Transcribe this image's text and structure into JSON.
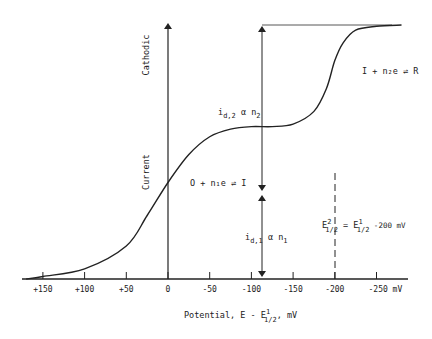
{
  "chart_data": {
    "type": "line",
    "title": "",
    "xlabel": "Potential, E - E¹₁/₂, mV",
    "xlabel_parts": {
      "main": "Potential, E - E",
      "sup": "1",
      "sub": "1/2",
      "tail": ", mV"
    },
    "ylabel_top": "Cathodic",
    "ylabel_bottom": "Current",
    "x_ticks": [
      "+150",
      "+100",
      "+50",
      "0",
      "-50",
      "-100",
      "-150",
      "-200",
      "-250 mV"
    ],
    "x_tick_values": [
      150,
      100,
      50,
      0,
      -50,
      -100,
      -150,
      -200,
      -250
    ],
    "xlim": [
      170,
      -280
    ],
    "grid": false,
    "series": [
      {
        "name": "two-step polarographic wave",
        "x": [
          170,
          150,
          100,
          50,
          25,
          0,
          -25,
          -50,
          -75,
          -100,
          -125,
          -150,
          -175,
          -190,
          -200,
          -210,
          -225,
          -250,
          -280
        ],
        "y": [
          0.0,
          0.01,
          0.04,
          0.13,
          0.25,
          0.38,
          0.49,
          0.56,
          0.59,
          0.6,
          0.6,
          0.61,
          0.66,
          0.75,
          0.86,
          0.93,
          0.98,
          0.995,
          1.0
        ]
      }
    ],
    "annotations": {
      "reaction_1": "O + n₁e ⇌ I",
      "reaction_2": "I + n₂e ⇌ R",
      "id1": {
        "main": "i",
        "sub": "d,1",
        "tail": " α n",
        "tail_sub": "1"
      },
      "id2": {
        "main": "i",
        "sub": "d,2",
        "tail": " α n",
        "tail_sub": "2"
      },
      "half_wave": {
        "lhs": "E",
        "lhs_sup": "2",
        "lhs_sub": "1/2",
        "eq": " = E",
        "rhs_sup": "1",
        "rhs_sub": "1/2",
        "tail": " -200 mV"
      }
    }
  }
}
